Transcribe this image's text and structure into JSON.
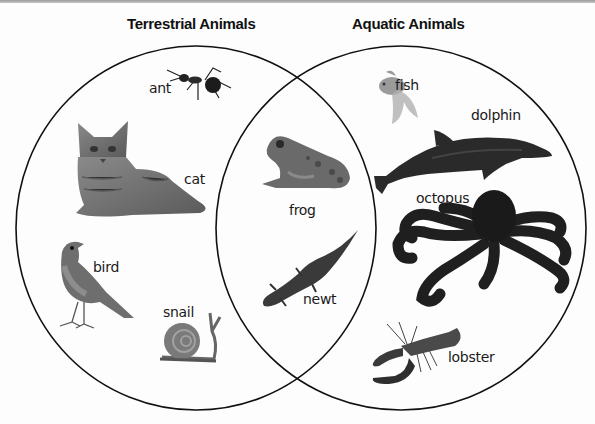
{
  "diagram": {
    "type": "venn",
    "sets": [
      {
        "id": "terrestrial",
        "title": "Terrestrial Animals"
      },
      {
        "id": "aquatic",
        "title": "Aquatic Animals"
      }
    ],
    "regions": {
      "terrestrial_only": [
        "ant",
        "cat",
        "bird",
        "snail"
      ],
      "both": [
        "frog",
        "newt"
      ],
      "aquatic_only": [
        "fish",
        "dolphin",
        "octopus",
        "lobster"
      ]
    },
    "labels": {
      "ant": "ant",
      "cat": "cat",
      "bird": "bird",
      "snail": "snail",
      "frog": "frog",
      "newt": "newt",
      "fish": "fish",
      "dolphin": "dolphin",
      "octopus": "octopus",
      "lobster": "lobster"
    },
    "colors": {
      "outline": "#111111",
      "background": "#fdfdfd",
      "text": "#1a1a1a"
    }
  }
}
